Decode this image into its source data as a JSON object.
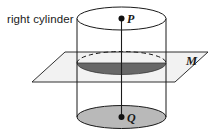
{
  "figure": {
    "caption": "right cylinder",
    "labels": {
      "top_point": "P",
      "bottom_point": "Q",
      "plane": "M"
    },
    "colors": {
      "stroke": "#1a1a1a",
      "cylinder_fill": "#ffffff",
      "plane_fill": "#f1f1f1",
      "cross_section_fill": "#676767",
      "base_fill": "#b9b9b9",
      "background": "#ffffff"
    },
    "geometry": {
      "cylinder": {
        "left_x": 77,
        "right_x": 166,
        "center_x": 121.5,
        "top_ellipse_cy": 18.5,
        "bottom_ellipse_cy": 117,
        "ellipse_rx": 44.5,
        "ellipse_ry": 11.5
      },
      "plane": {
        "points": "65,52 208,52 175,82 32,82",
        "label_anchor_x": 186,
        "label_anchor_y": 55
      },
      "cross_section": {
        "cx": 121.5,
        "cy": 63,
        "rx": 44.5,
        "ry": 11.5
      },
      "axis_segment": {
        "x": 121.5,
        "y1": 18.5,
        "y2": 117
      }
    }
  }
}
